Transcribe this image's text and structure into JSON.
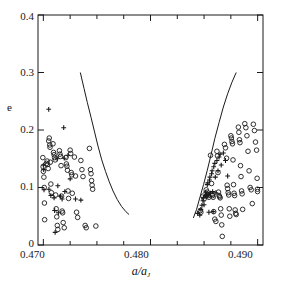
{
  "figure": {
    "name": "eccentricity-vs-semimajor-axis-scatter",
    "background_color": "#ffffff",
    "line_color": "#1a1a1a"
  },
  "axes": {
    "x_title_main": "a/a",
    "x_title_sub": "J",
    "y_title": "e",
    "x_ticklabels": [
      "0.470",
      "0.480",
      "0.490"
    ],
    "y_ticklabels": [
      "0",
      "0.1",
      "0.2",
      "0.3",
      "0.4"
    ]
  },
  "chart_data": {
    "type": "scatter",
    "title": "",
    "xlabel": "a/a_J",
    "ylabel": "e",
    "xlim": [
      0.4695,
      0.4905
    ],
    "ylim": [
      0.0,
      0.4
    ],
    "grid": false,
    "legend": "none",
    "x_major_ticks": [
      0.47,
      0.48,
      0.49
    ],
    "x_minor_ticks": [
      0.4725,
      0.475,
      0.4775,
      0.4825,
      0.485,
      0.4875
    ],
    "y_major_ticks": [
      0.0,
      0.1,
      0.2,
      0.3,
      0.4
    ],
    "series": [
      {
        "name": "open-circles",
        "marker": "circle-open",
        "points": [
          [
            0.46995,
            0.152
          ],
          [
            0.46998,
            0.136
          ],
          [
            0.47,
            0.128
          ],
          [
            0.47005,
            0.118
          ],
          [
            0.47008,
            0.1
          ],
          [
            0.4701,
            0.073
          ],
          [
            0.47012,
            0.044
          ],
          [
            0.4703,
            0.142
          ],
          [
            0.47035,
            0.146
          ],
          [
            0.4704,
            0.14
          ],
          [
            0.47045,
            0.133
          ],
          [
            0.4705,
            0.181
          ],
          [
            0.47055,
            0.186
          ],
          [
            0.4706,
            0.174
          ],
          [
            0.47062,
            0.17
          ],
          [
            0.47065,
            0.144
          ],
          [
            0.4707,
            0.106
          ],
          [
            0.47075,
            0.091
          ],
          [
            0.4709,
            0.176
          ],
          [
            0.47095,
            0.161
          ],
          [
            0.471,
            0.157
          ],
          [
            0.47105,
            0.152
          ],
          [
            0.4711,
            0.148
          ],
          [
            0.47115,
            0.087
          ],
          [
            0.4712,
            0.063
          ],
          [
            0.47125,
            0.049
          ],
          [
            0.4713,
            0.034
          ],
          [
            0.47135,
            0.027
          ],
          [
            0.4715,
            0.164
          ],
          [
            0.47155,
            0.158
          ],
          [
            0.4716,
            0.154
          ],
          [
            0.47165,
            0.138
          ],
          [
            0.4717,
            0.085
          ],
          [
            0.47175,
            0.059
          ],
          [
            0.4718,
            0.056
          ],
          [
            0.47185,
            0.039
          ],
          [
            0.47195,
            0.03
          ],
          [
            0.4721,
            0.152
          ],
          [
            0.47215,
            0.141
          ],
          [
            0.4722,
            0.137
          ],
          [
            0.47225,
            0.13
          ],
          [
            0.4723,
            0.094
          ],
          [
            0.47235,
            0.081
          ],
          [
            0.4725,
            0.165
          ],
          [
            0.47255,
            0.159
          ],
          [
            0.4726,
            0.126
          ],
          [
            0.47265,
            0.122
          ],
          [
            0.4727,
            0.09
          ],
          [
            0.4729,
            0.153
          ],
          [
            0.473,
            0.12
          ],
          [
            0.4731,
            0.057
          ],
          [
            0.4732,
            0.048
          ],
          [
            0.4735,
            0.147
          ],
          [
            0.4736,
            0.131
          ],
          [
            0.4737,
            0.119
          ],
          [
            0.4739,
            0.034
          ],
          [
            0.474,
            0.03
          ],
          [
            0.4743,
            0.168
          ],
          [
            0.4744,
            0.131
          ],
          [
            0.47445,
            0.124
          ],
          [
            0.4745,
            0.112
          ],
          [
            0.47455,
            0.104
          ],
          [
            0.4746,
            0.097
          ],
          [
            0.4749,
            0.033
          ],
          [
            0.48465,
            0.06
          ],
          [
            0.4847,
            0.057
          ],
          [
            0.4849,
            0.085
          ],
          [
            0.485,
            0.08
          ],
          [
            0.4852,
            0.096
          ],
          [
            0.4853,
            0.092
          ],
          [
            0.48535,
            0.088
          ],
          [
            0.4854,
            0.086
          ],
          [
            0.48545,
            0.083
          ],
          [
            0.4856,
            0.156
          ],
          [
            0.4857,
            0.107
          ],
          [
            0.48575,
            0.088
          ],
          [
            0.4858,
            0.086
          ],
          [
            0.48585,
            0.083
          ],
          [
            0.4859,
            0.058
          ],
          [
            0.486,
            0.045
          ],
          [
            0.4861,
            0.041
          ],
          [
            0.4862,
            0.163
          ],
          [
            0.48625,
            0.155
          ],
          [
            0.4863,
            0.126
          ],
          [
            0.48635,
            0.092
          ],
          [
            0.4864,
            0.086
          ],
          [
            0.48645,
            0.084
          ],
          [
            0.4865,
            0.082
          ],
          [
            0.48655,
            0.063
          ],
          [
            0.4866,
            0.052
          ],
          [
            0.48665,
            0.035
          ],
          [
            0.4867,
            0.015
          ],
          [
            0.4869,
            0.175
          ],
          [
            0.487,
            0.169
          ],
          [
            0.4871,
            0.151
          ],
          [
            0.48715,
            0.104
          ],
          [
            0.4872,
            0.098
          ],
          [
            0.48725,
            0.091
          ],
          [
            0.4873,
            0.087
          ],
          [
            0.48735,
            0.063
          ],
          [
            0.4874,
            0.05
          ],
          [
            0.4875,
            0.19
          ],
          [
            0.48755,
            0.186
          ],
          [
            0.4876,
            0.18
          ],
          [
            0.48765,
            0.176
          ],
          [
            0.4877,
            0.148
          ],
          [
            0.48775,
            0.105
          ],
          [
            0.4878,
            0.09
          ],
          [
            0.48785,
            0.086
          ],
          [
            0.4879,
            0.061
          ],
          [
            0.48795,
            0.055
          ],
          [
            0.488,
            0.053
          ],
          [
            0.4882,
            0.205
          ],
          [
            0.48825,
            0.196
          ],
          [
            0.4883,
            0.183
          ],
          [
            0.48835,
            0.178
          ],
          [
            0.4884,
            0.138
          ],
          [
            0.48845,
            0.119
          ],
          [
            0.4885,
            0.094
          ],
          [
            0.48855,
            0.089
          ],
          [
            0.4886,
            0.062
          ],
          [
            0.4888,
            0.211
          ],
          [
            0.4889,
            0.204
          ],
          [
            0.489,
            0.19
          ],
          [
            0.4891,
            0.163
          ],
          [
            0.4892,
            0.129
          ],
          [
            0.4893,
            0.1
          ],
          [
            0.4894,
            0.096
          ],
          [
            0.4895,
            0.072
          ],
          [
            0.4896,
            0.21
          ],
          [
            0.4897,
            0.199
          ],
          [
            0.4898,
            0.179
          ],
          [
            0.4899,
            0.165
          ],
          [
            0.48995,
            0.116
          ],
          [
            0.48998,
            0.097
          ],
          [
            0.48999,
            0.093
          ]
        ]
      },
      {
        "name": "plus-markers",
        "marker": "plus",
        "points": [
          [
            0.47,
            0.139
          ],
          [
            0.47003,
            0.131
          ],
          [
            0.47006,
            0.096
          ],
          [
            0.4705,
            0.236
          ],
          [
            0.47052,
            0.097
          ],
          [
            0.4707,
            0.086
          ],
          [
            0.471,
            0.082
          ],
          [
            0.47105,
            0.06
          ],
          [
            0.4711,
            0.022
          ],
          [
            0.4713,
            0.15
          ],
          [
            0.47135,
            0.103
          ],
          [
            0.4714,
            0.056
          ],
          [
            0.4716,
            0.085
          ],
          [
            0.47175,
            0.08
          ],
          [
            0.4719,
            0.204
          ],
          [
            0.47195,
            0.151
          ],
          [
            0.472,
            0.093
          ],
          [
            0.4723,
            0.156
          ],
          [
            0.4725,
            0.115
          ],
          [
            0.473,
            0.08
          ],
          [
            0.4735,
            0.078
          ],
          [
            0.4844,
            0.055
          ],
          [
            0.4846,
            0.052
          ],
          [
            0.4847,
            0.062
          ],
          [
            0.4848,
            0.069
          ],
          [
            0.4849,
            0.077
          ],
          [
            0.48495,
            0.082
          ],
          [
            0.485,
            0.07
          ],
          [
            0.4851,
            0.086
          ],
          [
            0.48515,
            0.092
          ],
          [
            0.4852,
            0.087
          ],
          [
            0.48525,
            0.084
          ],
          [
            0.4853,
            0.105
          ],
          [
            0.48535,
            0.108
          ],
          [
            0.4854,
            0.088
          ],
          [
            0.48545,
            0.057
          ],
          [
            0.4855,
            0.113
          ],
          [
            0.48555,
            0.118
          ],
          [
            0.4856,
            0.09
          ],
          [
            0.4857,
            0.124
          ],
          [
            0.48575,
            0.129
          ],
          [
            0.4858,
            0.093
          ],
          [
            0.48585,
            0.058
          ],
          [
            0.4859,
            0.136
          ],
          [
            0.486,
            0.142
          ],
          [
            0.48605,
            0.118
          ],
          [
            0.4861,
            0.091
          ],
          [
            0.4862,
            0.147
          ],
          [
            0.4863,
            0.129
          ],
          [
            0.4864,
            0.153
          ],
          [
            0.4865,
            0.158
          ],
          [
            0.4866,
            0.139
          ],
          [
            0.4868,
            0.16
          ],
          [
            0.487,
            0.147
          ],
          [
            0.4872,
            0.12
          ]
        ]
      }
    ],
    "curves": [
      {
        "name": "left-resonance-boundary",
        "points": [
          [
            0.47345,
            0.3
          ],
          [
            0.4738,
            0.272
          ],
          [
            0.4741,
            0.248
          ],
          [
            0.47445,
            0.222
          ],
          [
            0.4748,
            0.195
          ],
          [
            0.4751,
            0.172
          ],
          [
            0.47545,
            0.148
          ],
          [
            0.4758,
            0.128
          ],
          [
            0.47615,
            0.11
          ],
          [
            0.4765,
            0.094
          ],
          [
            0.4769,
            0.079
          ],
          [
            0.4773,
            0.067
          ],
          [
            0.4777,
            0.058
          ],
          [
            0.478,
            0.053
          ]
        ]
      },
      {
        "name": "right-resonance-boundary",
        "points": [
          [
            0.484,
            0.047
          ],
          [
            0.4843,
            0.062
          ],
          [
            0.4846,
            0.082
          ],
          [
            0.48495,
            0.105
          ],
          [
            0.4853,
            0.13
          ],
          [
            0.48565,
            0.157
          ],
          [
            0.486,
            0.185
          ],
          [
            0.4864,
            0.213
          ],
          [
            0.4868,
            0.24
          ],
          [
            0.4872,
            0.263
          ],
          [
            0.4876,
            0.283
          ],
          [
            0.488,
            0.3
          ]
        ]
      }
    ]
  }
}
